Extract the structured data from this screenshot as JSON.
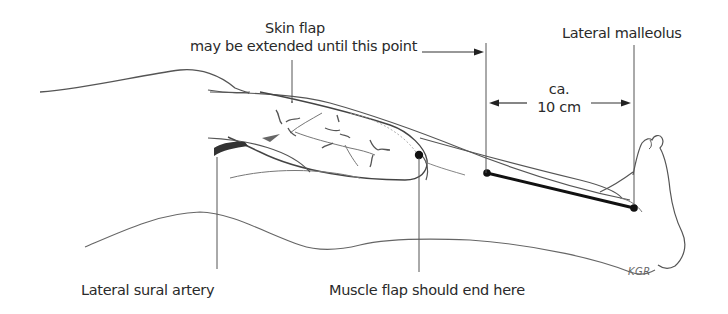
{
  "figure": {
    "labels": {
      "skin_flap_line1": "Skin flap",
      "skin_flap_line2": "may be extended until this point",
      "lateral_malleolus": "Lateral malleolus",
      "distance_line1": "ca.",
      "distance_line2": "10 cm",
      "lateral_sural_artery": "Lateral sural artery",
      "muscle_flap_end": "Muscle flap should end here",
      "signature": "KGR"
    },
    "colors": {
      "line": "#555555",
      "dark": "#111111",
      "background": "#ffffff"
    }
  }
}
